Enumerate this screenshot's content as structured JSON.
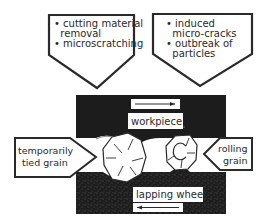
{
  "diagram": {
    "callouts_top": [
      {
        "id": "mechanisms-left",
        "lines": [
          "• cutting material",
          "  removal",
          "• microscratching"
        ]
      },
      {
        "id": "mechanisms-right",
        "lines": [
          "• induced",
          "  micro-cracks",
          "• outbreak of",
          "  particles"
        ]
      }
    ],
    "workpiece": {
      "label": "workpiece",
      "direction": "right"
    },
    "lapping_wheel": {
      "label": "lapping wheel",
      "direction": "left"
    },
    "grains": [
      {
        "id": "tied",
        "lines": [
          "temporarily",
          "tied grain"
        ]
      },
      {
        "id": "rolling",
        "lines": [
          "rolling",
          "grain"
        ]
      }
    ],
    "colors": {
      "dark_body": "#1c1c1c",
      "outline": "#2a2a2a",
      "background": "#ffffff"
    }
  }
}
